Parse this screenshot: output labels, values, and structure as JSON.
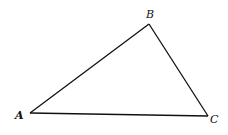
{
  "diagram": {
    "type": "triangle",
    "stroke_color": "#111111",
    "background": "#ffffff",
    "vertices": [
      {
        "name": "A",
        "label": "A",
        "x": 30,
        "y": 113
      },
      {
        "name": "B",
        "label": "B",
        "x": 149,
        "y": 24
      },
      {
        "name": "C",
        "label": "C",
        "x": 208,
        "y": 116
      }
    ],
    "edges": [
      {
        "from": "A",
        "to": "B",
        "label": "AB"
      },
      {
        "from": "B",
        "to": "C",
        "label": "BC"
      },
      {
        "from": "A",
        "to": "C",
        "label": "AC"
      }
    ]
  }
}
